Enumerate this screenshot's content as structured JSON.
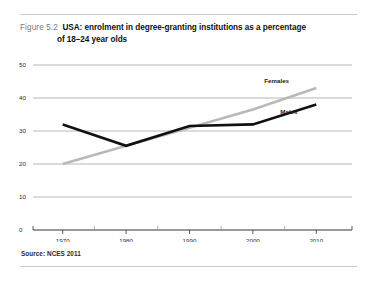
{
  "figure": {
    "number_label": "Figure 5.2",
    "title_line1": "USA: enrolment in degree-granting institutions as a percentage",
    "title_line2": "of 18–24 year olds",
    "source": "Source: NCES 2011"
  },
  "colors": {
    "females_line": "#b9b9b9",
    "males_line": "#111111",
    "gridline": "#9a9a9a",
    "axis": "#4a4a4a",
    "rule": "#c9c9c9",
    "figure_number_text": "#7b7b7b",
    "title_text": "#111111",
    "background": "#ffffff"
  },
  "chart_data": {
    "type": "line",
    "title": "USA: enrolment in degree-granting institutions as a percentage of 18–24 year olds",
    "xlabel": "",
    "ylabel": "",
    "x": [
      1970,
      1980,
      1990,
      2000,
      2010
    ],
    "categories": [
      "1970",
      "1980",
      "1990",
      "2000",
      "2010"
    ],
    "xlim": [
      1965,
      2015
    ],
    "ylim": [
      0,
      50
    ],
    "x_ticks": [
      1970,
      1980,
      1990,
      2000,
      2010
    ],
    "x_tick_labels": [
      "1970",
      "1980",
      "1990",
      "2000",
      "2010"
    ],
    "x_minor_ticks": [
      1975,
      1985,
      1995,
      2005
    ],
    "y_ticks": [
      0,
      10,
      20,
      30,
      40,
      50
    ],
    "y_tick_labels": [
      "0",
      "10",
      "20",
      "30",
      "40",
      "50"
    ],
    "grid": true,
    "grid_axis": "y",
    "legend": "inline-end-of-line",
    "series": [
      {
        "name": "Females",
        "color": "#b9b9b9",
        "values": [
          20.0,
          25.5,
          31.0,
          36.5,
          43.0
        ],
        "label_text": "Females"
      },
      {
        "name": "Males",
        "color": "#111111",
        "values": [
          32.0,
          25.5,
          31.5,
          32.0,
          38.0
        ],
        "label_text": "Males"
      }
    ],
    "source_note": "Source: NCES 2011"
  }
}
